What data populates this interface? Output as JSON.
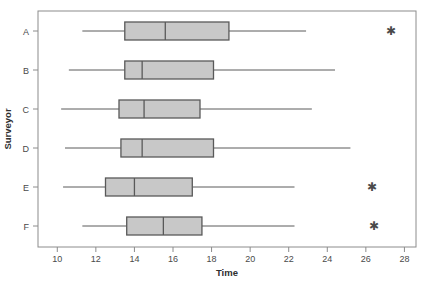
{
  "chart_data": {
    "type": "box",
    "title": "",
    "xlabel": "Time",
    "ylabel": "Surveyor",
    "orientation": "horizontal",
    "xlim": [
      9,
      28.6
    ],
    "grid": false,
    "legend": "none",
    "xticks": [
      10,
      12,
      14,
      16,
      18,
      20,
      22,
      24,
      26,
      28
    ],
    "xtick_labels": [
      "10",
      "12",
      "14",
      "16",
      "18",
      "20",
      "22",
      "24",
      "26",
      "28"
    ],
    "categories": [
      "A",
      "B",
      "C",
      "D",
      "E",
      "F"
    ],
    "boxes": [
      {
        "category": "A",
        "whisker_low": 11.3,
        "q1": 13.5,
        "median": 15.6,
        "q3": 18.9,
        "whisker_high": 22.9,
        "outliers": [
          27.3
        ]
      },
      {
        "category": "B",
        "whisker_low": 10.6,
        "q1": 13.5,
        "median": 14.4,
        "q3": 18.1,
        "whisker_high": 24.4,
        "outliers": []
      },
      {
        "category": "C",
        "whisker_low": 10.2,
        "q1": 13.2,
        "median": 14.5,
        "q3": 17.4,
        "whisker_high": 23.2,
        "outliers": []
      },
      {
        "category": "D",
        "whisker_low": 10.4,
        "q1": 13.3,
        "median": 14.4,
        "q3": 18.1,
        "whisker_high": 25.2,
        "outliers": []
      },
      {
        "category": "E",
        "whisker_low": 10.3,
        "q1": 12.5,
        "median": 14.0,
        "q3": 17.0,
        "whisker_high": 22.3,
        "outliers": [
          26.3
        ]
      },
      {
        "category": "F",
        "whisker_low": 11.3,
        "q1": 13.6,
        "median": 15.5,
        "q3": 17.5,
        "whisker_high": 22.3,
        "outliers": [
          26.4
        ]
      }
    ],
    "style": {
      "box_fill": "#c8c8c8",
      "box_stroke": "#595959",
      "whisker_stroke": "#5a5a5a",
      "outlier_marker": "asterisk",
      "frame_stroke": "#8c8c8c",
      "background": "#ffffff"
    }
  }
}
